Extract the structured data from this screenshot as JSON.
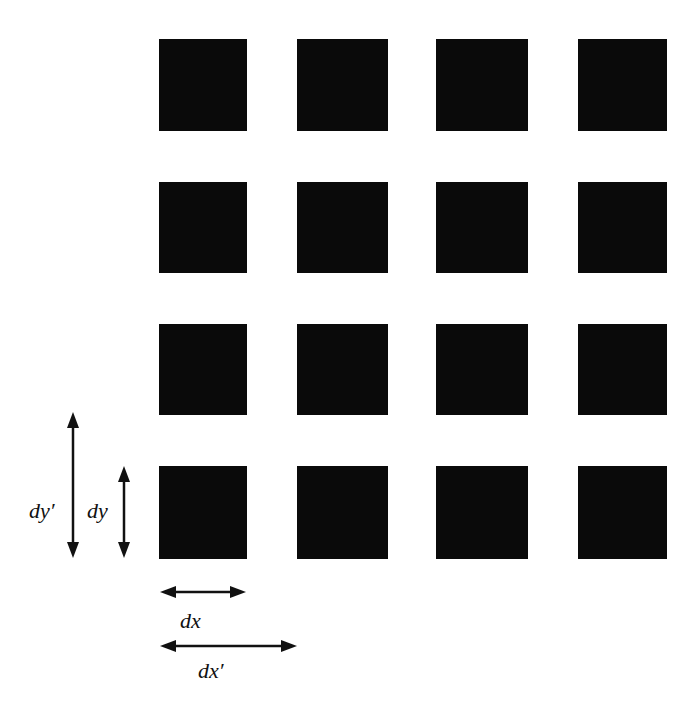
{
  "diagram": {
    "title": "",
    "grid": {
      "rows": 4,
      "cols": 4,
      "fill_color": "#0a0a0a"
    },
    "dimension_labels": {
      "dy_prime": "dy′",
      "dy": "dy",
      "dx": "dx",
      "dx_prime": "dx′"
    }
  }
}
